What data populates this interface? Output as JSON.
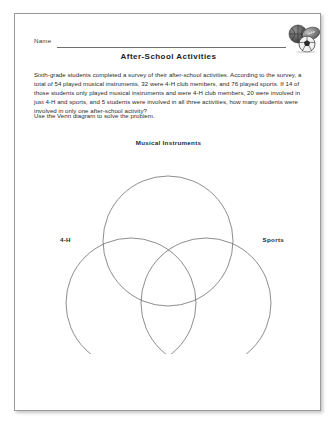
{
  "page": {
    "name_label": "Name",
    "title": "After-School Activities",
    "clipart_icon": "sports-balls-icon"
  },
  "problem": {
    "body": "Sixth-grade students completed a survey of their after-school activities. According to the survey, a total of 54 played musical instruments, 32 were 4-H club members, and 76 played sports. If 14 of those students only played musical instruments and were 4-H club members, 20 were involved in just 4-H and sports, and 5 students were involved in all three activities, how many students were involved in only one after-school activity?",
    "instruction": "Use the Venn diagram to solve the problem.",
    "values": {
      "total_musical_instruments": 54,
      "total_4h_members": 32,
      "total_sports": 76,
      "music_and_4h_only": 14,
      "4h_and_sports_only": 20,
      "all_three": 5
    }
  },
  "venn": {
    "label_top": "Musical Instruments",
    "label_left": "4-H",
    "label_right": "Sports",
    "circles": [
      {
        "name": "musical-instruments-circle",
        "cx": 141,
        "cy": 102,
        "r": 65
      },
      {
        "name": "four-h-circle",
        "cx": 104,
        "cy": 164,
        "r": 65
      },
      {
        "name": "sports-circle",
        "cx": 179,
        "cy": 164,
        "r": 65
      }
    ]
  },
  "colors": {
    "page_background": "#ffffff",
    "page_border": "#9a9a9a",
    "text": "#2a2a2a",
    "title": "#1c1c1c",
    "circle_stroke": "#5c5c5c",
    "rule": "#6e6e6e"
  }
}
